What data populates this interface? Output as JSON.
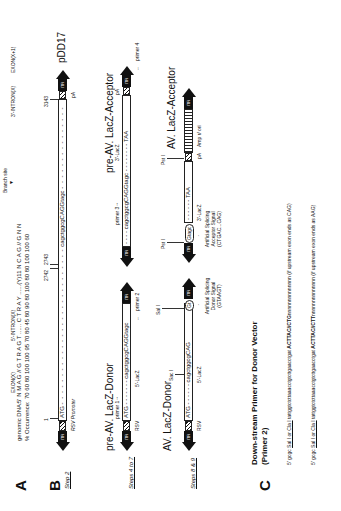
{
  "panelA": {
    "label": "A",
    "regions": {
      "exon_x": "EXON(X)",
      "intron5": "5'-INTRON(X)",
      "branch": "Branch site",
      "intron3": "3'-INTRON(X)",
      "exon_x1": "EXON(X+1)"
    },
    "genomic_label": "genomic DNA:",
    "genomic_seq": "5' N  M  A  G  //  G  T  R  A  G  T ......  C  T  R  A  Y ......(Y)11 N  C  A  G  //  G  N  N",
    "occurrence_label": "% Occurrence:",
    "occurrence_vals": "70  60  80    100 100  95  70  80  45      80  90  80 100  80        80 100  100  60"
  },
  "panelB": {
    "label": "B",
    "step2": {
      "step": "Step 2",
      "pos1": "1",
      "pos2742": "2742",
      "pos2743": "2743",
      "pos3143": "3143",
      "atg": "ATG",
      "seq": "cagctggcgCAGGtagc",
      "taa": "TAA",
      "pa": "pA",
      "itr": "ITR",
      "promoter": "RSV Promoter",
      "vector": "pDD17"
    },
    "step4to7": {
      "step": "Steps 4 to 7",
      "donor_title": "pre-AV. LacZ-Donor",
      "primer1": "primer 1",
      "atg": "ATG",
      "seq": "cagctggcgCAGGtagc",
      "primer2": "primer 2",
      "lacz5": "5'-LacZ",
      "rsv": "RSV",
      "itr": "ITR",
      "acceptor_title": "pre-AV. LacZ-Acceptor",
      "primer3": "primer 3",
      "acc_seq": "cagctggcgCAGGtagc",
      "taa": "TAA",
      "lacz3": "3'-LacZ",
      "pa": "pA",
      "primer4": "primer 4"
    },
    "step8and9": {
      "step": "Steps 8 & 9",
      "donor_title": "AV. LacZ-Donor",
      "sacI": "Sac I",
      "salI": "Sal I",
      "atg": "ATG",
      "seq": "cagctggcgCAG",
      "gt": "Gt",
      "lacz5": "5'-LacZ",
      "rsv": "RSV",
      "itr": "ITR",
      "donor_signal": "Artificial Splicing Donor Signal (GTAAGT)",
      "pstI_a": "Pst I",
      "pstI_b": "Pst I",
      "ag": "Gtagc",
      "acc_taa": "TAA",
      "lacz3": "3'-LacZ",
      "acceptor_signal": "Artificial Splicing Acceptor Signal (CTGAC...CAG)",
      "acceptor_title": "AV. LacZ-Acceptor",
      "pa": "pA",
      "amp": "Amp r/ ori"
    }
  },
  "panelC": {
    "label": "C",
    "title": "Down-stream Primer for Donor Vector",
    "subtitle": "(Primer 2)",
    "line1_prefix": "5' gcgc ",
    "line1_sites": "Sal I or  Cla I",
    "line1_mid": " tattggtctcttaaacctgtcttgaacctgat ",
    "line1_bold": "ACTTAC//CTG",
    "line1_tail": "nnnnnnnnnnnnnn (if upstream exon ends as CAG)",
    "line2_prefix": "5' gcgc ",
    "line2_sites": "Sal I or  Cla I",
    "line2_mid": " tattggtctcttaaacctgtcttgaacctgat ",
    "line2_bold": "ACTTAC//CTT",
    "line2_tail": "nnnnnnnnnnnnnn (if upstream exon ends as AAG)"
  }
}
